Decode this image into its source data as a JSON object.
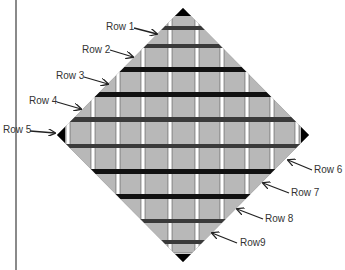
{
  "diagram": {
    "type": "quilt-diamond-layout",
    "colors": {
      "square": "#b8b8b8",
      "sashing": "#ffffff",
      "sashing_edge": "#555555",
      "bar_black": "#111111",
      "bar_dark": "#3a3a3a",
      "setting_triangle": "#7a7a7a",
      "corner": "#000000",
      "divider": "#8a8a8a"
    },
    "left_labels": [
      {
        "text": "Row 1",
        "x": 106,
        "y": 21,
        "ax1": 134,
        "ay1": 28,
        "ax2": 157,
        "ay2": 34
      },
      {
        "text": "Row 2",
        "x": 82,
        "y": 44,
        "ax1": 110,
        "ay1": 50,
        "ax2": 133,
        "ay2": 57
      },
      {
        "text": "Row 3",
        "x": 56,
        "y": 70,
        "ax1": 84,
        "ay1": 77,
        "ax2": 108,
        "ay2": 84
      },
      {
        "text": "Row 4",
        "x": 29,
        "y": 95,
        "ax1": 57,
        "ay1": 102,
        "ax2": 81,
        "ay2": 109
      },
      {
        "text": "Row 5",
        "x": 3,
        "y": 124,
        "ax1": 30,
        "ay1": 131,
        "ax2": 55,
        "ay2": 133
      }
    ],
    "right_labels": [
      {
        "text": "Row 6",
        "x": 314,
        "y": 164,
        "ax1": 312,
        "ay1": 170,
        "ax2": 288,
        "ay2": 160
      },
      {
        "text": "Row 7",
        "x": 291,
        "y": 187,
        "ax1": 289,
        "ay1": 193,
        "ax2": 263,
        "ay2": 183
      },
      {
        "text": "Row 8",
        "x": 265,
        "y": 213,
        "ax1": 263,
        "ay1": 219,
        "ax2": 237,
        "ay2": 209
      },
      {
        "text": "Row9",
        "x": 240,
        "y": 237,
        "ax1": 237,
        "ay1": 243,
        "ax2": 212,
        "ay2": 233
      }
    ]
  }
}
